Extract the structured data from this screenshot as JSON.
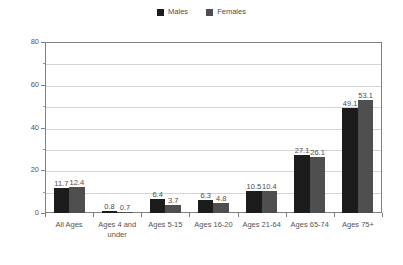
{
  "chart_data": {
    "type": "bar",
    "title": "",
    "subtitle": "",
    "xlabel": "",
    "ylabel": "",
    "ylim": [
      0,
      80
    ],
    "yticks": [
      0,
      20,
      40,
      60,
      80
    ],
    "yticks_minor": [
      10,
      30,
      50,
      70
    ],
    "grid": true,
    "grid_axis": "y",
    "legend_position": "top-center",
    "categories": [
      "All Ages",
      "Ages 4 and under",
      "Ages 5-15",
      "Ages 16-20",
      "Ages 21-64",
      "Ages 65-74",
      "Ages 75+"
    ],
    "series": [
      {
        "name": "Males",
        "color": "#1c1c1c",
        "values": [
          11.7,
          0.8,
          6.4,
          6.3,
          10.5,
          27.1,
          49.1
        ]
      },
      {
        "name": "Females",
        "color": "#4f4f4f",
        "values": [
          12.4,
          0.7,
          3.7,
          4.8,
          10.4,
          26.1,
          53.1
        ]
      }
    ],
    "value_labels": [
      [
        "11.7",
        "12.4"
      ],
      [
        "0.8",
        "0.7"
      ],
      [
        "6.4",
        "3.7"
      ],
      [
        "6.3",
        "4.8"
      ],
      [
        "10.5",
        "10.4"
      ],
      [
        "27.1",
        "26.1"
      ],
      [
        "49.1",
        "53.1"
      ]
    ]
  },
  "legend": {
    "items": [
      {
        "label": "Males",
        "color": "#1c1c1c"
      },
      {
        "label": "Females",
        "color": "#4f4f4f"
      }
    ]
  },
  "axis": {
    "y_tick_labels": [
      "80",
      "60",
      "40",
      "20",
      "0"
    ],
    "x_tick_labels": [
      "All Ages",
      "Ages 4 and under",
      "Ages 5-15",
      "Ages 16-20",
      "Ages 21-64",
      "Ages 65-74",
      "Ages 75+"
    ]
  },
  "colors": {
    "background": "#ffffff",
    "frame": "#808080",
    "gridline": "#d4d4d4",
    "text": "#555555",
    "males": "#1c1c1c",
    "females": "#4f4f4f"
  }
}
